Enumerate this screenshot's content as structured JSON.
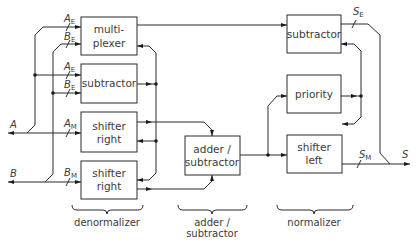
{
  "diagram": {
    "blocks": {
      "multiplexer": {
        "line1": "multi-",
        "line2": "plexer"
      },
      "subtractor_exp": {
        "line1": "subtractor"
      },
      "shifter_right_a": {
        "line1": "shifter",
        "line2": "right"
      },
      "shifter_right_b": {
        "line1": "shifter",
        "line2": "right"
      },
      "adder_subtractor": {
        "line1": "adder /",
        "line2": "subtractor"
      },
      "subtractor_norm": {
        "line1": "subtractor"
      },
      "priority": {
        "line1": "priority"
      },
      "shifter_left": {
        "line1": "shifter",
        "line2": "left"
      }
    },
    "signals": {
      "A": "A",
      "B": "B",
      "AE_main": "A",
      "AE_sub": "E",
      "BE_main": "B",
      "BE_sub": "E",
      "AM_main": "A",
      "AM_sub": "M",
      "BM_main": "B",
      "BM_sub": "M",
      "SE_main": "S",
      "SE_sub": "E",
      "SM_main": "S",
      "SM_sub": "M",
      "S": "S"
    },
    "stages": {
      "denormalizer": "denormalizer",
      "adder_line1": "adder /",
      "adder_line2": "subtractor",
      "normalizer": "normalizer"
    },
    "line_color": "#2b2b2b",
    "text_color": "#3a3a3a"
  }
}
